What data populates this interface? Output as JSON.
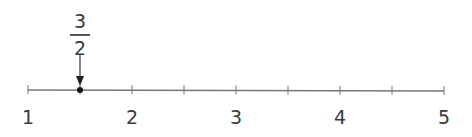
{
  "number_line": {
    "min": 1,
    "max": 5,
    "ticks_per_unit": 2,
    "labels": [
      "1",
      "2",
      "3",
      "4",
      "5"
    ],
    "marked_point": {
      "value": 1.5,
      "numerator": "3",
      "denominator": "2"
    },
    "colors": {
      "line": "#777777",
      "point": "#111111",
      "text": "#3a3a3a"
    }
  }
}
